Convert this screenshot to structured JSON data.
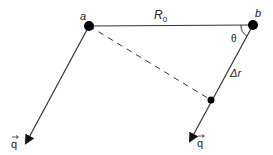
{
  "diagram": {
    "points": {
      "a": {
        "label": "a",
        "x": 89,
        "y": 26
      },
      "b": {
        "label": "b",
        "x": 253,
        "y": 25
      },
      "mid": {
        "x": 211,
        "y": 100
      }
    },
    "labels": {
      "distance": "R",
      "distance_sub": "0",
      "angle": "θ",
      "displacement": "Δr",
      "vector_left": "q",
      "vector_right": "q"
    },
    "colors": {
      "line": "#333333",
      "dot": "#000000"
    }
  }
}
